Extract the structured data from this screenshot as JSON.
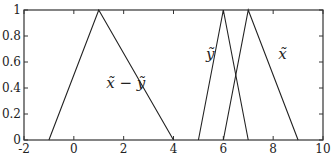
{
  "chart_data": {
    "type": "line",
    "title": "",
    "xlabel": "",
    "ylabel": "",
    "xlim": [
      -2,
      10
    ],
    "ylim": [
      0,
      1
    ],
    "grid": false,
    "legend": "none",
    "x_ticks": [
      -2,
      0,
      2,
      4,
      6,
      8,
      10
    ],
    "x_tick_labels": [
      "-2",
      "0",
      "2",
      "4",
      "6",
      "8",
      "10"
    ],
    "y_ticks": [
      0,
      0.2,
      0.4,
      0.6,
      0.8,
      1
    ],
    "y_tick_labels": [
      "0",
      "0.2",
      "0.4",
      "0.6",
      "0.8",
      "1"
    ],
    "series": [
      {
        "name": "x̃ − ỹ",
        "x": [
          -1,
          1,
          4
        ],
        "y": [
          0,
          1,
          0
        ],
        "label_pos": [
          1.3,
          0.4
        ]
      },
      {
        "name": "ỹ",
        "x": [
          5,
          6,
          7
        ],
        "y": [
          0,
          1,
          0
        ],
        "label_pos": [
          5.3,
          0.62
        ]
      },
      {
        "name": "x̃",
        "x": [
          6,
          7,
          9
        ],
        "y": [
          0,
          1,
          0
        ],
        "label_pos": [
          8.2,
          0.62
        ]
      }
    ]
  },
  "plot_box": {
    "left": 24,
    "right": 323,
    "top": 10,
    "bottom": 140
  },
  "colors": {
    "line": "#222222",
    "axis": "#333333",
    "background": "#ffffff"
  }
}
